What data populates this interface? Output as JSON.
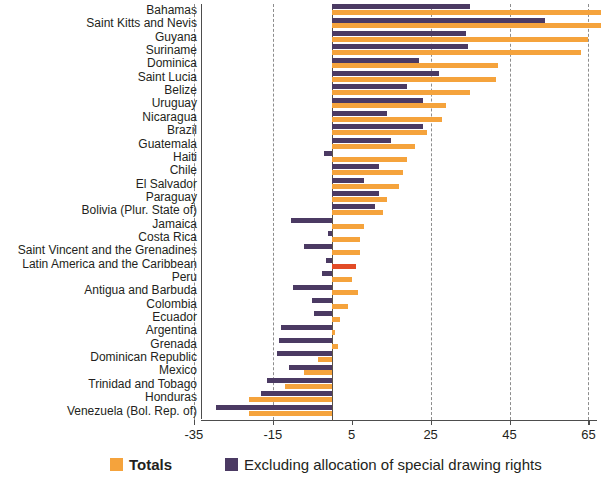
{
  "chart_data": {
    "type": "bar",
    "orientation": "horizontal",
    "title": "",
    "subtitle": "",
    "xlabel": "",
    "ylabel": "",
    "xlim": [
      -35,
      65.5
    ],
    "xticks": [
      -35,
      -15,
      5,
      25,
      45,
      65
    ],
    "xticklabels": [
      "-35",
      "-15",
      "5",
      "25",
      "45",
      "65"
    ],
    "grid": "vertical-dashed",
    "legend_position": "bottom",
    "zero_line": 0,
    "categories": [
      "Bahamas",
      "Saint Kitts and Nevis",
      "Guyana",
      "Suriname",
      "Dominica",
      "Saint Lucia",
      "Belize",
      "Uruguay",
      "Nicaragua",
      "Brazil",
      "Guatemala",
      "Haiti",
      "Chile",
      "El Salvador",
      "Paraguay",
      "Bolivia (Plur. State of)",
      "Jamaica",
      "Costa Rica",
      "Saint Vincent and the Grenadines",
      "Latin America and the Caribbean",
      "Peru",
      "Antigua and Barbuda",
      "Colombia",
      "Ecuador",
      "Argentina",
      "Grenada",
      "Dominican Republic",
      "Mexico",
      "Trinidad and Tobago",
      "Honduras",
      "Venezuela (Bol. Rep. of)"
    ],
    "series": [
      {
        "name": "Totals",
        "color": "#f5a33c",
        "values": [
          68.5,
          68.5,
          65.0,
          63.0,
          42.0,
          41.5,
          35.0,
          29.0,
          28.0,
          24.0,
          21.0,
          19.0,
          18.0,
          17.0,
          14.0,
          13.0,
          8.0,
          7.0,
          7.0,
          6.0,
          5.0,
          6.5,
          4.0,
          2.0,
          0.8,
          1.5,
          -3.5,
          -7.0,
          -12.0,
          -21.0,
          -21.0
        ]
      },
      {
        "name": "Excluding allocation of special drawing rights",
        "color": "#4b3a63",
        "values": [
          35.0,
          54.0,
          34.0,
          34.5,
          22.0,
          27.0,
          19.0,
          23.0,
          14.0,
          23.0,
          15.0,
          -2.0,
          12.0,
          8.0,
          12.0,
          11.0,
          -10.5,
          -1.0,
          -7.0,
          -1.5,
          -2.5,
          -10.0,
          -5.0,
          -4.5,
          -13.0,
          -13.5,
          -14.0,
          -11.0,
          -16.5,
          -18.0,
          -29.5
        ]
      }
    ],
    "highlight_rows": {
      "Latin America and the Caribbean": "#e24b26"
    }
  },
  "legend": {
    "items": [
      {
        "label": "Totals",
        "color": "#f5a33c",
        "icon": "legend-swatch-orange"
      },
      {
        "label": "Excluding allocation of special drawing rights",
        "color": "#4b3a63",
        "icon": "legend-swatch-purple"
      }
    ]
  }
}
